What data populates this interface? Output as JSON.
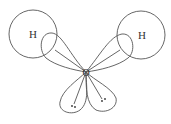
{
  "diagram": {
    "colors": {
      "stroke": "#555555",
      "text": "#333333",
      "background": "#ffffff"
    },
    "atoms": [
      {
        "id": "h-left",
        "label": "H",
        "cx": 33,
        "cy": 34,
        "r": 24
      },
      {
        "id": "h-right",
        "label": "H",
        "cx": 141,
        "cy": 35,
        "r": 24
      },
      {
        "id": "oxygen",
        "label": "O",
        "cx": 86,
        "cy": 72
      }
    ],
    "lone_pairs": [
      {
        "id": "lp-left",
        "symbol": "••"
      },
      {
        "id": "lp-right",
        "symbol": "••"
      }
    ]
  }
}
